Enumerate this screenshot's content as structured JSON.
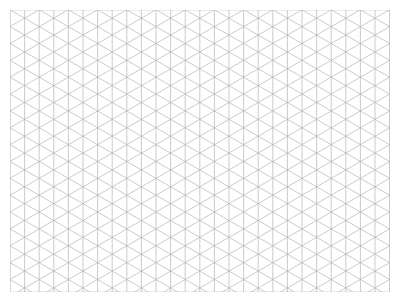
{
  "caption": "",
  "paper": {
    "type": "isometric-grid",
    "line_color": "#b4b4b4",
    "vertical_spacing_px": 14.6,
    "angle_deg": 30
  }
}
